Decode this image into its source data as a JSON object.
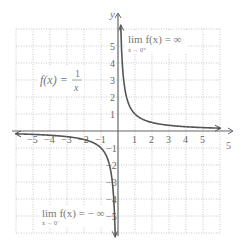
{
  "chart_data": {
    "type": "line",
    "title": "",
    "function_label": {
      "lhs": "f(x) =",
      "num": "1",
      "den": "x"
    },
    "xlabel": "x",
    "ylabel": "y",
    "xlim": [
      -6,
      6
    ],
    "ylim": [
      -6,
      6
    ],
    "grid": true,
    "x_ticks": [
      -5,
      -4,
      -3,
      -2,
      -1,
      1,
      2,
      3,
      4,
      5
    ],
    "y_ticks": [
      -5,
      -4,
      -3,
      -2,
      -1,
      1,
      2,
      3,
      4,
      5
    ],
    "x_tick_labels": [
      "−5",
      "−4",
      "−3",
      "−2",
      "−1",
      "1",
      "2",
      "3",
      "4",
      "5"
    ],
    "y_tick_labels": [
      "−5",
      "−4",
      "−3",
      "−2",
      "−1",
      "1",
      "2",
      "3",
      "4",
      "5"
    ],
    "series": [
      {
        "name": "f(x) = 1/x (x>0)",
        "x": [
          0.167,
          0.2,
          0.25,
          0.333,
          0.5,
          1,
          2,
          3,
          4,
          5,
          6
        ],
        "y": [
          6,
          5,
          4,
          3,
          2,
          1,
          0.5,
          0.333,
          0.25,
          0.2,
          0.167
        ]
      },
      {
        "name": "f(x) = 1/x (x<0)",
        "x": [
          -6,
          -5,
          -4,
          -3,
          -2,
          -1,
          -0.5,
          -0.333,
          -0.25,
          -0.2,
          -0.167
        ],
        "y": [
          -0.167,
          -0.2,
          -0.25,
          -0.333,
          -0.5,
          -1,
          -2,
          -3,
          -4,
          -5,
          -6
        ]
      }
    ],
    "annotations": [
      {
        "text": "lim f(x) = ∞",
        "sub": "x→0⁺",
        "position": "upper-right"
      },
      {
        "text": "lim f(x) = −∞",
        "sub": "x→0⁻",
        "position": "lower-left"
      }
    ]
  },
  "labels": {
    "y_axis": "y",
    "x_axis_end": "5",
    "func_lhs": "f(x) =",
    "func_num": "1",
    "func_den": "x",
    "lim_pos": "lim f(x) = ∞",
    "lim_pos_sub": "x → 0⁺",
    "lim_neg": "lim f(x) = − ∞",
    "lim_neg_sub": "x → 0⁻"
  }
}
